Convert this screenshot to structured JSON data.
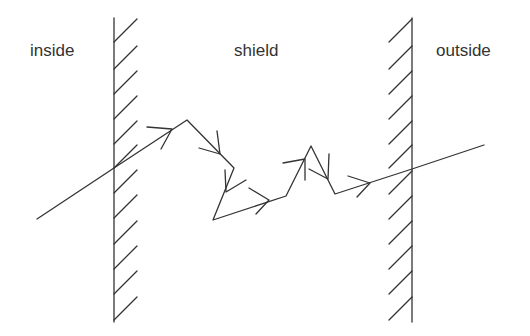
{
  "diagram": {
    "stroke_color": "#333333",
    "background": "#ffffff",
    "labels": {
      "inside": "inside",
      "shield": "shield",
      "outside": "outside"
    },
    "regions": [
      {
        "name": "inside",
        "label": "inside"
      },
      {
        "name": "shield",
        "label": "shield"
      },
      {
        "name": "outside",
        "label": "outside"
      }
    ],
    "walls": [
      {
        "name": "inner-wall",
        "x": 114,
        "y_top": 18,
        "y_bottom": 322,
        "hatch_side": "right"
      },
      {
        "name": "outer-wall",
        "x": 412,
        "y_top": 18,
        "y_bottom": 322,
        "hatch_side": "left"
      }
    ],
    "path": {
      "vertices": [
        [
          37,
          219
        ],
        [
          114,
          168
        ],
        [
          187,
          120
        ],
        [
          234,
          168
        ],
        [
          213,
          220
        ],
        [
          286,
          196
        ],
        [
          311,
          146
        ],
        [
          335,
          194
        ],
        [
          412,
          169
        ],
        [
          484,
          145
        ]
      ],
      "arrow_count": 7
    }
  }
}
